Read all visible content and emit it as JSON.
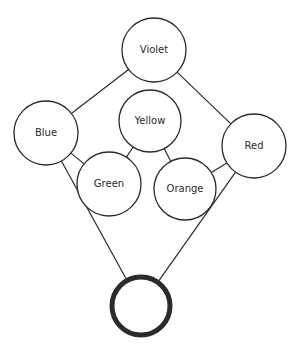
{
  "diagram": {
    "type": "graph",
    "stroke_color": "#2b2b2b",
    "background": "#ffffff",
    "nodes": [
      {
        "id": "violet",
        "label": "Violet",
        "cx": 154,
        "cy": 50,
        "r": 32,
        "stroke_width": 1.3
      },
      {
        "id": "yellow",
        "label": "Yellow",
        "cx": 150,
        "cy": 121,
        "r": 31,
        "stroke_width": 1.3
      },
      {
        "id": "blue",
        "label": "Blue",
        "cx": 46,
        "cy": 133,
        "r": 32,
        "stroke_width": 1.3
      },
      {
        "id": "red",
        "label": "Red",
        "cx": 254,
        "cy": 146,
        "r": 32,
        "stroke_width": 1.3
      },
      {
        "id": "green",
        "label": "Green",
        "cx": 109,
        "cy": 184,
        "r": 32,
        "stroke_width": 1.3
      },
      {
        "id": "orange",
        "label": "Orange",
        "cx": 185,
        "cy": 189,
        "r": 31,
        "stroke_width": 1.3
      },
      {
        "id": "bottom",
        "label": "",
        "cx": 141,
        "cy": 306,
        "r": 29,
        "stroke_width": 5
      }
    ],
    "edges": [
      {
        "from": "violet",
        "to": "blue"
      },
      {
        "from": "violet",
        "to": "red"
      },
      {
        "from": "blue",
        "to": "green"
      },
      {
        "from": "yellow",
        "to": "green"
      },
      {
        "from": "yellow",
        "to": "orange"
      },
      {
        "from": "orange",
        "to": "red"
      },
      {
        "from": "blue",
        "to": "bottom"
      },
      {
        "from": "red",
        "to": "bottom"
      }
    ]
  }
}
